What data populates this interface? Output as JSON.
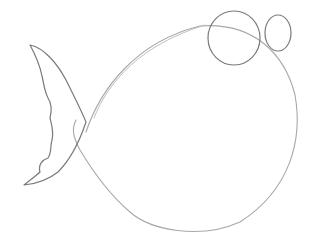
{
  "image": {
    "subject": "Pencil sketch of a round fish",
    "background_color": "#ffffff",
    "stroke_color_dark": "#7a7a7a",
    "stroke_color_light": "#a8a8a8",
    "parts": [
      "body-circle",
      "tail-fin",
      "eye-large",
      "eye-small"
    ]
  }
}
